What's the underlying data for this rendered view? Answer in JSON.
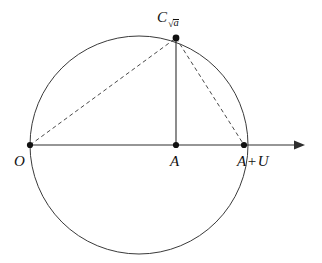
{
  "figure": {
    "kind": "geometric-construction",
    "background_color": "#ffffff",
    "stroke_color": "#2e2e2e",
    "circle_stroke_color": "#3a3a3a",
    "dash_stroke_color": "#4a4a4a",
    "point_color": "#111111"
  },
  "geometry": {
    "circle": {
      "center_x": 139,
      "center_y": 145,
      "radius": 109
    },
    "axis": {
      "y": 145,
      "x_start": 30,
      "x_end": 305,
      "arrow": "right"
    },
    "points": [
      {
        "id": "O",
        "x": 30,
        "y": 145
      },
      {
        "id": "A",
        "x": 176,
        "y": 145
      },
      {
        "id": "AU",
        "x": 244,
        "y": 145
      },
      {
        "id": "C",
        "x": 176,
        "y": 38
      }
    ],
    "solid_segments": [
      {
        "from": "C",
        "to": "A"
      }
    ],
    "dashed_segments": [
      {
        "from": "O",
        "to": "C"
      },
      {
        "from": "C",
        "to": "AU"
      }
    ]
  },
  "labels": {
    "apex": {
      "main": "C",
      "subscript_radical_body": "a",
      "radical_sign": "√",
      "full_text": "C_√a"
    },
    "origin": {
      "text": "O"
    },
    "center": {
      "text": "A"
    },
    "right": {
      "lead": "A",
      "operator": "+",
      "trail": "U",
      "full_text": "A + U"
    }
  }
}
